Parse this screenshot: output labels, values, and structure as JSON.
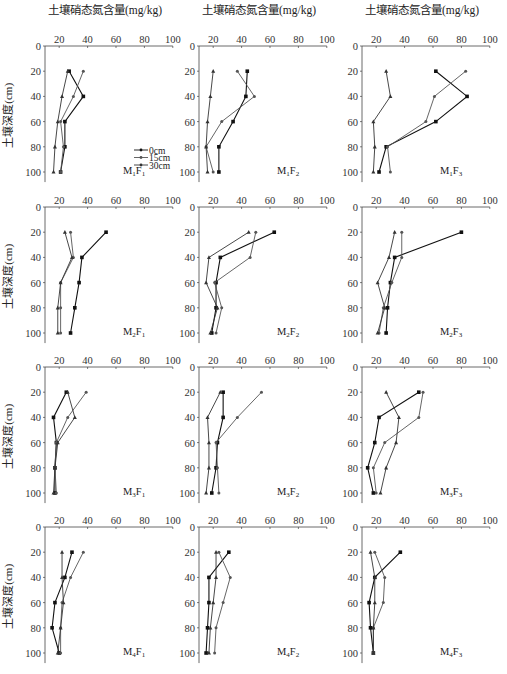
{
  "figure": {
    "column_title": "土壤硝态氮含量(mg/kg)",
    "ylabel": "土壤深度(cm)",
    "legend": [
      "0cm",
      "15cm",
      "30cm"
    ],
    "x_ticks": [
      20,
      40,
      60,
      80,
      100
    ],
    "y_ticks": [
      0,
      20,
      40,
      60,
      80,
      100
    ]
  },
  "chart_data": [
    {
      "type": "line",
      "title": "M1F1",
      "xlabel": "土壤硝态氮含量(mg/kg)",
      "ylabel": "土壤深度(cm)",
      "xlim": [
        10,
        100
      ],
      "ylim": [
        0,
        105
      ],
      "depth": [
        20,
        40,
        60,
        80,
        100
      ],
      "series": [
        {
          "name": "0cm",
          "values": [
            27,
            37,
            24,
            24,
            21
          ]
        },
        {
          "name": "15cm",
          "values": [
            37,
            30,
            21,
            23,
            21
          ]
        },
        {
          "name": "30cm",
          "values": [
            26,
            22,
            19,
            17,
            16
          ]
        }
      ]
    },
    {
      "type": "line",
      "title": "M1F2",
      "xlabel": "土壤硝态氮含量(mg/kg)",
      "ylabel": "土壤深度(cm)",
      "xlim": [
        10,
        100
      ],
      "ylim": [
        0,
        105
      ],
      "depth": [
        20,
        40,
        60,
        80,
        100
      ],
      "series": [
        {
          "name": "0cm",
          "values": [
            44,
            43,
            34,
            24,
            24
          ]
        },
        {
          "name": "15cm",
          "values": [
            37,
            49,
            26,
            15,
            20
          ]
        },
        {
          "name": "30cm",
          "values": [
            20,
            18,
            16,
            15,
            16
          ]
        }
      ]
    },
    {
      "type": "line",
      "title": "M1F3",
      "xlabel": "土壤硝态氮含量(mg/kg)",
      "ylabel": "土壤深度(cm)",
      "xlim": [
        10,
        100
      ],
      "ylim": [
        0,
        105
      ],
      "depth": [
        20,
        40,
        60,
        80,
        100
      ],
      "series": [
        {
          "name": "0cm",
          "values": [
            62,
            84,
            62,
            27,
            22
          ]
        },
        {
          "name": "15cm",
          "values": [
            83,
            61,
            55,
            28,
            30
          ]
        },
        {
          "name": "30cm",
          "values": [
            27,
            30,
            18,
            19,
            18
          ]
        }
      ]
    },
    {
      "type": "line",
      "title": "M2F1",
      "xlabel": "土壤硝态氮含量(mg/kg)",
      "ylabel": "土壤深度(cm)",
      "xlim": [
        10,
        100
      ],
      "ylim": [
        0,
        105
      ],
      "depth": [
        20,
        40,
        60,
        80,
        100
      ],
      "series": [
        {
          "name": "0cm",
          "values": [
            53,
            36,
            34,
            31,
            28
          ]
        },
        {
          "name": "15cm",
          "values": [
            28,
            30,
            21,
            21,
            21
          ]
        },
        {
          "name": "30cm",
          "values": [
            24,
            29,
            21,
            19,
            19
          ]
        }
      ]
    },
    {
      "type": "line",
      "title": "M2F2",
      "xlabel": "土壤硝态氮含量(mg/kg)",
      "ylabel": "土壤深度(cm)",
      "xlim": [
        10,
        100
      ],
      "ylim": [
        0,
        105
      ],
      "depth": [
        20,
        40,
        60,
        80,
        100
      ],
      "series": [
        {
          "name": "0cm",
          "values": [
            63,
            25,
            22,
            22,
            19
          ]
        },
        {
          "name": "15cm",
          "values": [
            50,
            46,
            21,
            26,
            22
          ]
        },
        {
          "name": "30cm",
          "values": [
            45,
            17,
            15,
            23,
            18
          ]
        }
      ]
    },
    {
      "type": "line",
      "title": "M2F3",
      "xlabel": "土壤硝态氮含量(mg/kg)",
      "ylabel": "土壤深度(cm)",
      "xlim": [
        10,
        100
      ],
      "ylim": [
        0,
        105
      ],
      "depth": [
        20,
        40,
        60,
        80,
        100
      ],
      "series": [
        {
          "name": "0cm",
          "values": [
            80,
            33,
            30,
            28,
            27
          ]
        },
        {
          "name": "15cm",
          "values": [
            38,
            38,
            31,
            25,
            22
          ]
        },
        {
          "name": "30cm",
          "values": [
            33,
            29,
            21,
            26,
            21
          ]
        }
      ]
    },
    {
      "type": "line",
      "title": "M3F1",
      "xlabel": "土壤硝态氮含量(mg/kg)",
      "ylabel": "土壤深度(cm)",
      "xlim": [
        10,
        100
      ],
      "ylim": [
        0,
        105
      ],
      "depth": [
        20,
        40,
        60,
        80,
        100
      ],
      "series": [
        {
          "name": "0cm",
          "values": [
            25,
            16,
            18,
            17,
            17
          ]
        },
        {
          "name": "15cm",
          "values": [
            39,
            26,
            18,
            17,
            18
          ]
        },
        {
          "name": "30cm",
          "values": [
            26,
            31,
            19,
            17,
            16
          ]
        }
      ]
    },
    {
      "type": "line",
      "title": "M3F2",
      "xlabel": "土壤硝态氮含量(mg/kg)",
      "ylabel": "土壤深度(cm)",
      "xlim": [
        10,
        100
      ],
      "ylim": [
        0,
        105
      ],
      "depth": [
        20,
        40,
        60,
        80,
        100
      ],
      "series": [
        {
          "name": "0cm",
          "values": [
            27,
            27,
            23,
            22,
            19
          ]
        },
        {
          "name": "15cm",
          "values": [
            54,
            37,
            22,
            23,
            24
          ]
        },
        {
          "name": "30cm",
          "values": [
            25,
            16,
            17,
            17,
            15
          ]
        }
      ]
    },
    {
      "type": "line",
      "title": "M3F3",
      "xlabel": "土壤硝态氮含量(mg/kg)",
      "ylabel": "土壤深度(cm)",
      "xlim": [
        10,
        100
      ],
      "ylim": [
        0,
        105
      ],
      "depth": [
        20,
        40,
        60,
        80,
        100
      ],
      "series": [
        {
          "name": "0cm",
          "values": [
            50,
            22,
            19,
            14,
            18
          ]
        },
        {
          "name": "15cm",
          "values": [
            53,
            50,
            26,
            18,
            20
          ]
        },
        {
          "name": "30cm",
          "values": [
            27,
            36,
            34,
            27,
            23
          ]
        }
      ]
    },
    {
      "type": "line",
      "title": "M4F1",
      "xlabel": "土壤硝态氮含量(mg/kg)",
      "ylabel": "土壤深度(cm)",
      "xlim": [
        10,
        100
      ],
      "ylim": [
        0,
        105
      ],
      "depth": [
        20,
        40,
        60,
        80,
        100
      ],
      "series": [
        {
          "name": "0cm",
          "values": [
            29,
            24,
            17,
            15,
            20
          ]
        },
        {
          "name": "15cm",
          "values": [
            37,
            28,
            22,
            21,
            21
          ]
        },
        {
          "name": "30cm",
          "values": [
            22,
            22,
            23,
            21,
            19
          ]
        }
      ]
    },
    {
      "type": "line",
      "title": "M4F2",
      "xlabel": "土壤硝态氮含量(mg/kg)",
      "ylabel": "土壤深度(cm)",
      "xlim": [
        10,
        100
      ],
      "ylim": [
        0,
        105
      ],
      "depth": [
        20,
        40,
        60,
        80,
        100
      ],
      "series": [
        {
          "name": "0cm",
          "values": [
            31,
            17,
            17,
            16,
            15
          ]
        },
        {
          "name": "15cm",
          "values": [
            24,
            32,
            27,
            22,
            21
          ]
        },
        {
          "name": "30cm",
          "values": [
            22,
            22,
            20,
            18,
            17
          ]
        }
      ]
    },
    {
      "type": "line",
      "title": "M4F3",
      "xlabel": "土壤硝态氮含量(mg/kg)",
      "ylabel": "土壤深度(cm)",
      "xlim": [
        10,
        100
      ],
      "ylim": [
        0,
        105
      ],
      "depth": [
        20,
        40,
        60,
        80,
        100
      ],
      "series": [
        {
          "name": "0cm",
          "values": [
            37,
            19,
            15,
            16,
            18
          ]
        },
        {
          "name": "15cm",
          "values": [
            19,
            26,
            25,
            18,
            18
          ]
        },
        {
          "name": "30cm",
          "values": [
            16,
            19,
            19,
            18,
            18
          ]
        }
      ]
    }
  ],
  "panel_labels": [
    {
      "m": "M",
      "ms": "1",
      "f": "F",
      "fs": "1"
    },
    {
      "m": "M",
      "ms": "1",
      "f": "F",
      "fs": "2"
    },
    {
      "m": "M",
      "ms": "1",
      "f": "F",
      "fs": "3"
    },
    {
      "m": "M",
      "ms": "2",
      "f": "F",
      "fs": "1"
    },
    {
      "m": "M",
      "ms": "2",
      "f": "F",
      "fs": "2"
    },
    {
      "m": "M",
      "ms": "2",
      "f": "F",
      "fs": "3"
    },
    {
      "m": "M",
      "ms": "3",
      "f": "F",
      "fs": "1"
    },
    {
      "m": "M",
      "ms": "3",
      "f": "F",
      "fs": "2"
    },
    {
      "m": "M",
      "ms": "3",
      "f": "F",
      "fs": "3"
    },
    {
      "m": "M",
      "ms": "4",
      "f": "F",
      "fs": "1"
    },
    {
      "m": "M",
      "ms": "4",
      "f": "F",
      "fs": "2"
    },
    {
      "m": "M",
      "ms": "4",
      "f": "F",
      "fs": "3"
    }
  ]
}
